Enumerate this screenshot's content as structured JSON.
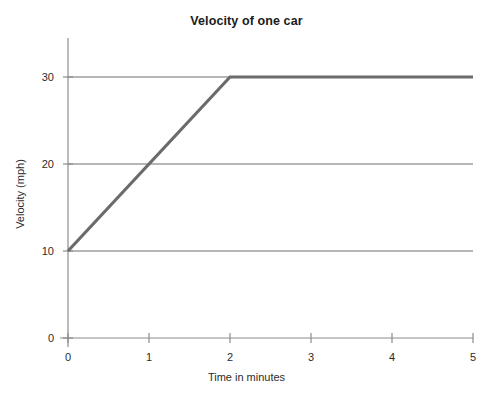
{
  "chart_data": {
    "type": "line",
    "title": "Velocity of one car",
    "xlabel": "Time in minutes",
    "ylabel": "Velocity (mph)",
    "xlim": [
      0,
      5
    ],
    "ylim": [
      0,
      35
    ],
    "xticks": [
      "0",
      "1",
      "2",
      "3",
      "4",
      "5"
    ],
    "yticks": [
      "0",
      "10",
      "20",
      "30"
    ],
    "gridlines_y": [
      10,
      20,
      30
    ],
    "grid": true,
    "legend": null,
    "series": [
      {
        "name": "velocity",
        "color": "#6b6b6b",
        "x": [
          0,
          1,
          2,
          5
        ],
        "values": [
          10,
          20,
          30,
          30
        ]
      }
    ],
    "annotations": []
  },
  "style": {
    "axis_color": "#8c8c8c",
    "grid_color": "#6e6e6e",
    "line_color": "#6b6b6b",
    "text_color": "#2b2b2b",
    "title_color": "#1a1a1a",
    "background": "#ffffff"
  }
}
